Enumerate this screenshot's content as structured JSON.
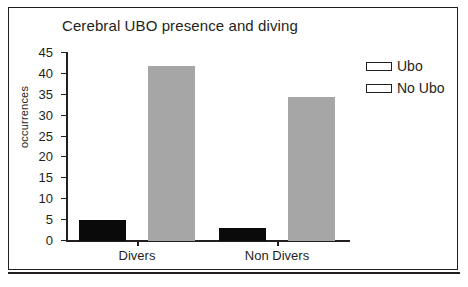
{
  "chart_data": {
    "type": "bar",
    "title": "Cerebral UBO presence and diving",
    "xlabel": "",
    "ylabel": "occurrences",
    "categories": [
      "Divers",
      "Non Divers"
    ],
    "series": [
      {
        "name": "Ubo",
        "values": [
          5,
          3
        ],
        "color": "#0a0a0a"
      },
      {
        "name": "No Ubo",
        "values": [
          42,
          34.5
        ],
        "color": "#a6a6a6"
      }
    ],
    "ylim": [
      0,
      45
    ],
    "ytick_step": 5,
    "yticks": [
      0,
      5,
      10,
      15,
      20,
      25,
      30,
      35,
      40,
      45
    ],
    "ytick_labels": [
      "0",
      "5",
      "10",
      "15",
      "20",
      "25",
      "30",
      "35",
      "40",
      "45"
    ],
    "grid": false,
    "legend_position": "right-top",
    "frame": true
  },
  "legend": {
    "items": [
      {
        "label": "Ubo"
      },
      {
        "label": "No Ubo"
      }
    ]
  }
}
